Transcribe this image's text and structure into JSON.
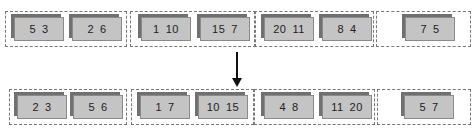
{
  "diagram": {
    "before": {
      "groups": [
        {
          "blocks": [
            {
              "values": [
                "5",
                "3"
              ]
            },
            {
              "values": [
                "2",
                "6"
              ]
            }
          ]
        },
        {
          "blocks": [
            {
              "values": [
                "1",
                "10"
              ]
            },
            {
              "values": [
                "15",
                "7"
              ]
            }
          ]
        },
        {
          "blocks": [
            {
              "values": [
                "20",
                "11"
              ]
            },
            {
              "values": [
                "8",
                "4"
              ]
            }
          ]
        },
        {
          "blocks": [
            {
              "values": [
                "7",
                "5"
              ]
            }
          ]
        }
      ]
    },
    "after": {
      "groups": [
        {
          "blocks": [
            {
              "values": [
                "2",
                "3"
              ]
            },
            {
              "values": [
                "5",
                "6"
              ]
            }
          ]
        },
        {
          "blocks": [
            {
              "values": [
                "1",
                "7"
              ]
            },
            {
              "values": [
                "10",
                "15"
              ]
            }
          ]
        },
        {
          "blocks": [
            {
              "values": [
                "4",
                "8"
              ]
            },
            {
              "values": [
                "11",
                "20"
              ]
            }
          ]
        },
        {
          "blocks": [
            {
              "values": [
                "5",
                "7"
              ]
            }
          ]
        }
      ]
    },
    "arrow": "down-arrow"
  }
}
